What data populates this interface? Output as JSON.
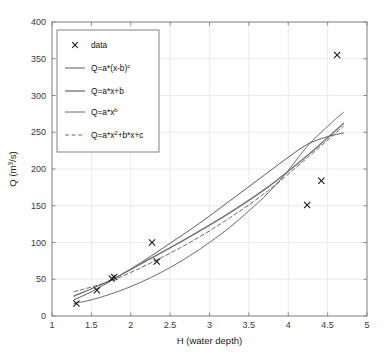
{
  "chart_data": {
    "type": "scatter",
    "title": "",
    "xlabel": "H (water depth)",
    "ylabel": "Q (m^3/s)",
    "ylabel_base": "Q (m",
    "ylabel_sup": "3",
    "ylabel_tail": "/s)",
    "xlim": [
      1,
      5
    ],
    "ylim": [
      0,
      400
    ],
    "grid": true,
    "legend_position": "upper-left",
    "xticks": [
      1,
      1.5,
      2,
      2.5,
      3,
      3.5,
      4,
      4.5,
      5
    ],
    "xtick_labels": [
      "1",
      "1.5",
      "2",
      "2.5",
      "3",
      "3.5",
      "4",
      "4.5",
      "5"
    ],
    "yticks": [
      0,
      50,
      100,
      150,
      200,
      250,
      300,
      350,
      400
    ],
    "ytick_labels": [
      "0",
      "50",
      "100",
      "150",
      "200",
      "250",
      "300",
      "350",
      "400"
    ],
    "points": {
      "name": "data",
      "marker": "x",
      "color": "#1a1a1a",
      "x": [
        1.31,
        1.57,
        1.76,
        1.79,
        2.27,
        2.33,
        4.24,
        4.42,
        4.62
      ],
      "y": [
        17,
        35,
        51,
        53,
        100,
        74,
        151,
        184,
        355
      ]
    },
    "series": [
      {
        "name": "Q=a*(x-b)^c",
        "label_base": "Q=a*(x-b)",
        "label_sup": "c",
        "style": "solid",
        "color": "#4a4a4a",
        "width": 0.9,
        "x": [
          1.28,
          1.5,
          1.75,
          2.0,
          2.25,
          2.5,
          2.75,
          3.0,
          3.25,
          3.5,
          3.75,
          4.0,
          4.25,
          4.5,
          4.7
        ],
        "y": [
          22,
          33,
          48,
          64,
          81,
          99,
          117,
          136,
          156,
          176,
          196,
          216,
          234,
          244,
          249
        ]
      },
      {
        "name": "Q=a*x+b",
        "label_base": "Q=a*x+b",
        "label_sup": "",
        "style": "solid",
        "color": "#6e6e6e",
        "width": 1.3,
        "x": [
          1.28,
          1.75,
          2.25,
          2.75,
          3.25,
          3.75,
          4.25,
          4.7
        ],
        "y": [
          27,
          49,
          78,
          108,
          140,
          176,
          219,
          262
        ]
      },
      {
        "name": "Q=a*x^b",
        "label_base": "Q=a*x",
        "label_sup": "b",
        "style": "solid",
        "color": "#5a5a5a",
        "width": 0.9,
        "x": [
          1.28,
          1.5,
          1.75,
          2.0,
          2.25,
          2.5,
          2.75,
          3.0,
          3.25,
          3.5,
          3.75,
          4.0,
          4.25,
          4.5,
          4.7
        ],
        "y": [
          17,
          22,
          30,
          40,
          52,
          66,
          82,
          100,
          120,
          143,
          168,
          198,
          232,
          258,
          277
        ]
      },
      {
        "name": "Q=a*x^2+b*x+c",
        "label_base": "Q=a*x",
        "label_sup": "2",
        "label_tail": "+b*x+c",
        "style": "dashed",
        "color": "#5a5a5a",
        "width": 0.9,
        "x": [
          1.28,
          1.75,
          2.25,
          2.75,
          3.25,
          3.75,
          4.25,
          4.7
        ],
        "y": [
          33,
          48,
          72,
          100,
          133,
          171,
          216,
          258
        ]
      }
    ],
    "legend_entries": [
      {
        "marker": "x",
        "label": "data"
      },
      {
        "marker": "line-solid",
        "label": "Q=a*(x-b)^c"
      },
      {
        "marker": "line-solid-thick",
        "label": "Q=a*x+b"
      },
      {
        "marker": "line-solid",
        "label": "Q=a*x^b"
      },
      {
        "marker": "line-dashed",
        "label": "Q=a*x^2+b*x+c"
      }
    ]
  },
  "colors": {
    "axis": "#888888",
    "grid": "#e6e6e6",
    "text": "#333333",
    "marker": "#1a1a1a",
    "legend_border": "#777777",
    "background": "#ffffff"
  }
}
